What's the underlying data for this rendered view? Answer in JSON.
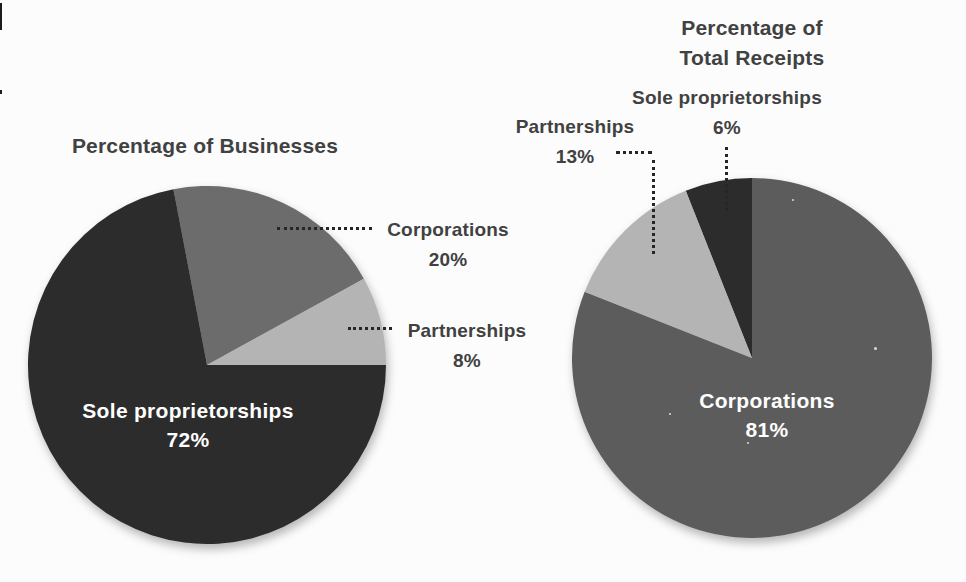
{
  "page": {
    "colors": {
      "background": "#fcfcfc",
      "text": "#414141",
      "leader_dots": "#262626",
      "inside_label_text": "#ffffff"
    }
  },
  "chart_data": [
    {
      "type": "pie",
      "title": "Percentage of Businesses",
      "units": "%",
      "total": 100,
      "start_angle_deg": -10.8,
      "legend": "none",
      "slices": [
        {
          "label": "Corporations",
          "value": 20,
          "display": "20%",
          "color": "#6c6c6c",
          "label_position": "outside-right-dotted-leader"
        },
        {
          "label": "Partnerships",
          "value": 8,
          "display": "8%",
          "color": "#b4b4b4",
          "label_position": "outside-right-dotted-leader"
        },
        {
          "label": "Sole proprietorships",
          "value": 72,
          "display": "72%",
          "color": "#2c2c2c",
          "label_position": "inside",
          "label_color": "#ffffff"
        }
      ]
    },
    {
      "type": "pie",
      "title": "Percentage of Total Receipts",
      "units": "%",
      "total": 100,
      "start_angle_deg": -21.6,
      "legend": "none",
      "slices": [
        {
          "label": "Sole proprietorships",
          "value": 6,
          "display": "6%",
          "color": "#2c2c2c",
          "label_position": "outside-top-dotted-leader"
        },
        {
          "label": "Corporations",
          "value": 81,
          "display": "81%",
          "color": "#5c5c5c",
          "label_position": "inside",
          "label_color": "#ffffff"
        },
        {
          "label": "Partnerships",
          "value": 13,
          "display": "13%",
          "color": "#b4b4b4",
          "label_position": "outside-top-dotted-leader"
        }
      ]
    }
  ]
}
